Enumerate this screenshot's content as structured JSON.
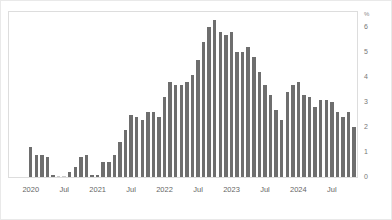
{
  "chart_data": {
    "type": "bar",
    "title": "",
    "subtitle": "",
    "xlabel": "",
    "ylabel": "",
    "unit_label": "%",
    "ylim": [
      0,
      6.6
    ],
    "grid": false,
    "legend": null,
    "y_ticks": [
      0,
      1,
      2,
      3,
      4,
      5,
      6
    ],
    "y_tick_labels": [
      "0",
      "1",
      "2",
      "3",
      "4",
      "5",
      "6"
    ],
    "x_tick_labels": [
      "2020",
      "Jul",
      "2021",
      "Jul",
      "2022",
      "Jul",
      "2023",
      "Jul",
      "2024",
      "Jul"
    ],
    "x_tick_indices": [
      0,
      6,
      12,
      18,
      24,
      30,
      36,
      42,
      48,
      54
    ],
    "bar_color": "#6e6e6e",
    "categories": [
      "2020-01",
      "2020-02",
      "2020-03",
      "2020-04",
      "2020-05",
      "2020-06",
      "2020-07",
      "2020-08",
      "2020-09",
      "2020-10",
      "2020-11",
      "2020-12",
      "2021-01",
      "2021-02",
      "2021-03",
      "2021-04",
      "2021-05",
      "2021-06",
      "2021-07",
      "2021-08",
      "2021-09",
      "2021-10",
      "2021-11",
      "2021-12",
      "2022-01",
      "2022-02",
      "2022-03",
      "2022-04",
      "2022-05",
      "2022-06",
      "2022-07",
      "2022-08",
      "2022-09",
      "2022-10",
      "2022-11",
      "2022-12",
      "2023-01",
      "2023-02",
      "2023-03",
      "2023-04",
      "2023-05",
      "2023-06",
      "2023-07",
      "2023-08",
      "2023-09",
      "2023-10",
      "2023-11",
      "2023-12",
      "2024-01",
      "2024-02",
      "2024-03",
      "2024-04",
      "2024-05",
      "2024-06",
      "2024-07",
      "2024-08",
      "2024-09",
      "2024-10",
      "2024-11"
    ],
    "values": [
      1.2,
      0.9,
      0.9,
      0.8,
      0.1,
      0.0,
      0.0,
      0.2,
      0.4,
      0.8,
      0.9,
      0.1,
      0.1,
      0.6,
      0.6,
      0.9,
      1.4,
      1.9,
      2.5,
      2.4,
      2.3,
      2.6,
      2.6,
      2.4,
      3.2,
      3.8,
      3.7,
      3.7,
      3.8,
      4.1,
      4.7,
      5.4,
      6.0,
      6.3,
      5.8,
      5.7,
      5.8,
      5.0,
      5.0,
      5.2,
      4.8,
      4.2,
      3.7,
      3.3,
      2.7,
      2.3,
      3.4,
      3.7,
      3.8,
      3.3,
      3.2,
      2.8,
      3.1,
      3.1,
      3.0,
      2.6,
      2.4,
      2.6,
      2.0
    ]
  }
}
